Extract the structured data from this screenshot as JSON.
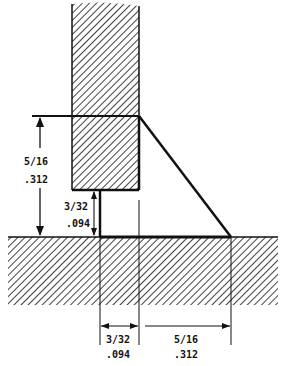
{
  "diagram": {
    "type": "fillet-weld-cross-section",
    "colors": {
      "ink": "#111111",
      "background": "#ffffff"
    },
    "dimensions": {
      "vertical_leg": {
        "fraction": "5/16",
        "decimal": ".312"
      },
      "root_gap_vertical": {
        "fraction": "3/32",
        "decimal": ".094"
      },
      "root_gap_horizontal": {
        "fraction": "3/32",
        "decimal": ".094"
      },
      "horizontal_leg": {
        "fraction": "5/16",
        "decimal": ".312"
      }
    }
  }
}
